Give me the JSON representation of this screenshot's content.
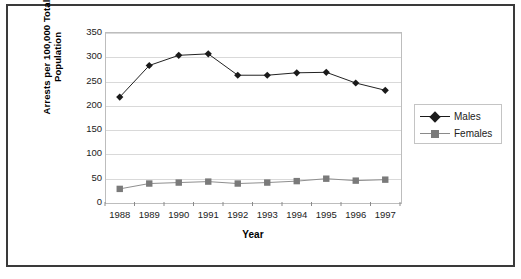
{
  "chart_data": {
    "type": "line",
    "title": "",
    "xlabel": "Year",
    "ylabel": "Arrests per 100,000 Total Population",
    "ylabel_line1": "Arrests per 100,000 Total",
    "ylabel_line2": "Population",
    "categories": [
      "1988",
      "1989",
      "1990",
      "1991",
      "1992",
      "1993",
      "1994",
      "1995",
      "1996",
      "1997"
    ],
    "ylim": [
      0,
      350
    ],
    "yticks": [
      350,
      300,
      250,
      200,
      150,
      100,
      50,
      0
    ],
    "grid": true,
    "legend_position": "right",
    "series": [
      {
        "name": "Males",
        "marker": "diamond",
        "color": "#1a1a1a",
        "values": [
          216,
          281,
          302,
          305,
          261,
          261,
          266,
          267,
          245,
          230
        ]
      },
      {
        "name": "Females",
        "marker": "square",
        "color": "#7a7a7a",
        "values": [
          27,
          38,
          40,
          42,
          38,
          40,
          43,
          48,
          44,
          46
        ]
      }
    ]
  },
  "legend": {
    "items": [
      {
        "label": "Males"
      },
      {
        "label": "Females"
      }
    ]
  },
  "caption": ""
}
